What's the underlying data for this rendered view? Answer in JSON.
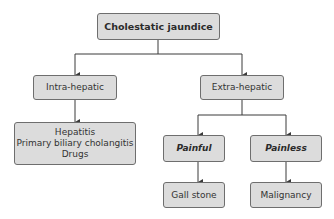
{
  "diagram": {
    "root": {
      "label": "Cholestatic jaundice"
    },
    "intra": {
      "label": "Intra-hepatic",
      "causes": [
        "Hepatitis",
        "Primary biliary cholangitis",
        "Drugs"
      ]
    },
    "extra": {
      "label": "Extra-hepatic",
      "painful": {
        "label": "Painful",
        "cause": "Gall stone"
      },
      "painless": {
        "label": "Painless",
        "cause": "Malignancy"
      }
    }
  },
  "colors": {
    "box_fill": "#dcdcdc",
    "box_border": "#6e6e6e",
    "line": "#3a3a3a",
    "text": "#333333"
  }
}
